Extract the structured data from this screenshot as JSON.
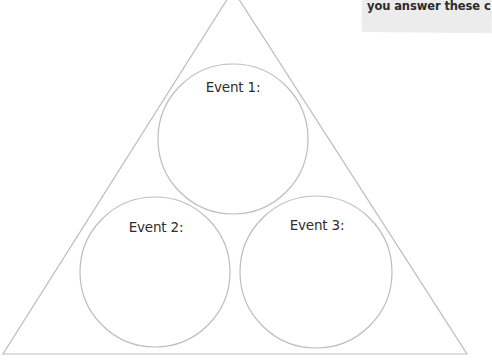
{
  "callout": {
    "text": "you answer these c"
  },
  "diagram": {
    "type": "triangle-with-three-circles",
    "colors": {
      "stroke": "#bdbdbd",
      "callout_bg": "#ececec",
      "text": "#2e2e2e"
    },
    "events": [
      {
        "label": "Event 1:",
        "value": ""
      },
      {
        "label": "Event 2:",
        "value": ""
      },
      {
        "label": "Event 3:",
        "value": ""
      }
    ]
  }
}
